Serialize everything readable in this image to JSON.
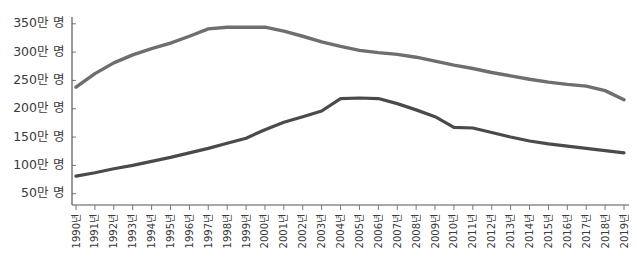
{
  "chart_data": {
    "type": "line",
    "title": "",
    "subtitle": "",
    "xlabel": "",
    "ylabel": "",
    "grid": false,
    "legend": "none",
    "unit_label": "만 명",
    "x": [
      "1990년",
      "1991년",
      "1992년",
      "1993년",
      "1994년",
      "1995년",
      "1996년",
      "1997년",
      "1998년",
      "1999년",
      "2000년",
      "2001년",
      "2002년",
      "2003년",
      "2004년",
      "2005년",
      "2006년",
      "2007년",
      "2008년",
      "2009년",
      "2010년",
      "2011년",
      "2012년",
      "2013년",
      "2014년",
      "2015년",
      "2016년",
      "2017년",
      "2018년",
      "2019년"
    ],
    "ytick_labels": [
      "50만 명",
      "100만 명",
      "150만 명",
      "200만 명",
      "250만 명",
      "300만 명",
      "350만 명"
    ],
    "ytick_values": [
      50,
      100,
      150,
      200,
      250,
      300,
      350
    ],
    "ylim": [
      30,
      362
    ],
    "series": [
      {
        "name": "upper-series",
        "color": "#6e6e6e",
        "width": 3.4,
        "values": [
          238,
          262,
          281,
          295,
          306,
          316,
          328,
          341,
          344,
          344,
          344,
          337,
          328,
          318,
          310,
          303,
          299,
          296,
          291,
          284,
          277,
          271,
          264,
          258,
          252,
          247,
          243,
          240,
          232,
          216
        ]
      },
      {
        "name": "lower-series",
        "color": "#4a4a4a",
        "width": 3.2,
        "values": [
          81,
          87,
          94,
          100,
          107,
          114,
          122,
          130,
          139,
          148,
          163,
          176,
          186,
          196,
          218,
          219,
          218,
          209,
          198,
          186,
          167,
          166,
          158,
          150,
          143,
          138,
          134,
          130,
          126,
          122
        ]
      }
    ]
  }
}
